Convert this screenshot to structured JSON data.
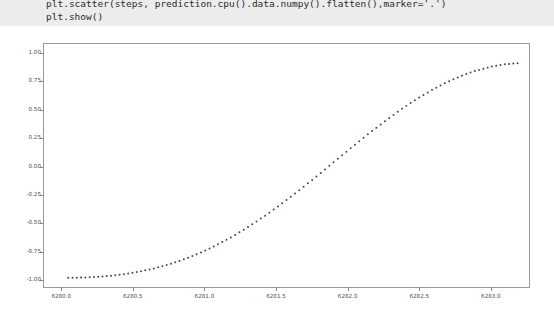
{
  "code_cell": {
    "lines": [
      "plt.scatter(steps, prediction.cpu().data.numpy().flatten(),marker='.')",
      "plt.show()"
    ],
    "background_color": "#ececec",
    "text_color": "#2b2b2b"
  },
  "chart_data": {
    "type": "scatter",
    "title": "",
    "xlabel": "",
    "ylabel": "",
    "marker": ".",
    "marker_color": "#3b4a6b",
    "marker_size_px": 2,
    "grid": false,
    "legend": null,
    "xlim": [
      6279.88,
      6283.28
    ],
    "ylim": [
      -1.08,
      1.08
    ],
    "xticks": [
      6280.0,
      6280.5,
      6281.0,
      6281.5,
      6282.0,
      6282.5,
      6283.0
    ],
    "xtick_labels": [
      "6280.0",
      "6280.5",
      "6281.0",
      "6281.5",
      "6282.0",
      "6282.5",
      "6283.0"
    ],
    "yticks": [
      1.0,
      0.75,
      0.5,
      0.25,
      0.0,
      -0.25,
      -0.5,
      -0.75,
      -1.0
    ],
    "ytick_labels": [
      "1.00",
      "0.75",
      "0.50",
      "0.25",
      "0.00",
      "-0.25",
      "-0.50",
      "-0.75",
      "-1.00"
    ],
    "x": [
      6280.05,
      6280.08,
      6280.11,
      6280.14,
      6280.17,
      6280.2,
      6280.23,
      6280.26,
      6280.29,
      6280.32,
      6280.35,
      6280.38,
      6280.41,
      6280.44,
      6280.47,
      6280.5,
      6280.53,
      6280.56,
      6280.59,
      6280.62,
      6280.65,
      6280.68,
      6280.71,
      6280.74,
      6280.77,
      6280.8,
      6280.83,
      6280.86,
      6280.89,
      6280.92,
      6280.95,
      6280.98,
      6281.01,
      6281.04,
      6281.07,
      6281.1,
      6281.13,
      6281.16,
      6281.19,
      6281.22,
      6281.25,
      6281.28,
      6281.31,
      6281.34,
      6281.37,
      6281.4,
      6281.43,
      6281.46,
      6281.49,
      6281.52,
      6281.55,
      6281.58,
      6281.61,
      6281.64,
      6281.67,
      6281.7,
      6281.73,
      6281.76,
      6281.79,
      6281.82,
      6281.85,
      6281.88,
      6281.91,
      6281.94,
      6281.97,
      6282.0,
      6282.03,
      6282.06,
      6282.09,
      6282.12,
      6282.15,
      6282.18,
      6282.21,
      6282.24,
      6282.27,
      6282.3,
      6282.33,
      6282.36,
      6282.39,
      6282.42,
      6282.45,
      6282.48,
      6282.51,
      6282.54,
      6282.57,
      6282.6,
      6282.63,
      6282.66,
      6282.69,
      6282.72,
      6282.75,
      6282.78,
      6282.81,
      6282.84,
      6282.87,
      6282.9,
      6282.93,
      6282.96,
      6282.99,
      6283.02,
      6283.05,
      6283.08,
      6283.11,
      6283.14,
      6283.17,
      6283.2
    ],
    "y": [
      -0.998,
      -0.998,
      -0.997,
      -0.996,
      -0.995,
      -0.993,
      -0.991,
      -0.989,
      -0.986,
      -0.983,
      -0.979,
      -0.975,
      -0.971,
      -0.966,
      -0.96,
      -0.954,
      -0.947,
      -0.94,
      -0.932,
      -0.924,
      -0.915,
      -0.905,
      -0.895,
      -0.884,
      -0.873,
      -0.861,
      -0.848,
      -0.834,
      -0.82,
      -0.805,
      -0.789,
      -0.773,
      -0.756,
      -0.738,
      -0.72,
      -0.701,
      -0.681,
      -0.66,
      -0.639,
      -0.617,
      -0.594,
      -0.571,
      -0.547,
      -0.523,
      -0.498,
      -0.472,
      -0.446,
      -0.419,
      -0.392,
      -0.364,
      -0.336,
      -0.307,
      -0.278,
      -0.249,
      -0.219,
      -0.189,
      -0.158,
      -0.128,
      -0.097,
      -0.066,
      -0.035,
      -0.003,
      0.028,
      0.06,
      0.091,
      0.122,
      0.154,
      0.185,
      0.216,
      0.246,
      0.277,
      0.307,
      0.336,
      0.365,
      0.394,
      0.422,
      0.45,
      0.477,
      0.504,
      0.53,
      0.555,
      0.58,
      0.604,
      0.627,
      0.649,
      0.671,
      0.692,
      0.712,
      0.731,
      0.749,
      0.766,
      0.783,
      0.798,
      0.813,
      0.826,
      0.839,
      0.85,
      0.861,
      0.87,
      0.879,
      0.887,
      0.893,
      0.899,
      0.903,
      0.907,
      0.909
    ]
  },
  "figure": {
    "background_color": "#ffffff",
    "axes_border_color": "#9a9a9a",
    "tick_color": "#8a8a8a",
    "tick_label_color": "#4d4d4d"
  }
}
